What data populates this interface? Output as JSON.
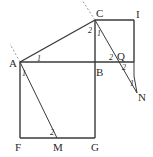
{
  "diagram": {
    "points": {
      "A": {
        "label": "A",
        "x": 20,
        "y": 62
      },
      "B": {
        "label": "B",
        "x": 95,
        "y": 62
      },
      "C": {
        "label": "C",
        "x": 95,
        "y": 20
      },
      "I": {
        "label": "I",
        "x": 134,
        "y": 20
      },
      "F": {
        "label": "F",
        "x": 20,
        "y": 138
      },
      "G": {
        "label": "G",
        "x": 95,
        "y": 138
      },
      "M": {
        "label": "M",
        "x": 57,
        "y": 138
      },
      "Q": {
        "label": "Q",
        "x": 119,
        "y": 62
      },
      "N": {
        "label": "N",
        "x": 137,
        "y": 94
      }
    },
    "angle_marks": {
      "A_top": "1",
      "A_bottom": "1",
      "C_left": "2",
      "C_right": "1",
      "B_Q_left": "2",
      "Q_right": "2",
      "N_mark": "1",
      "M_mark": "2"
    }
  }
}
